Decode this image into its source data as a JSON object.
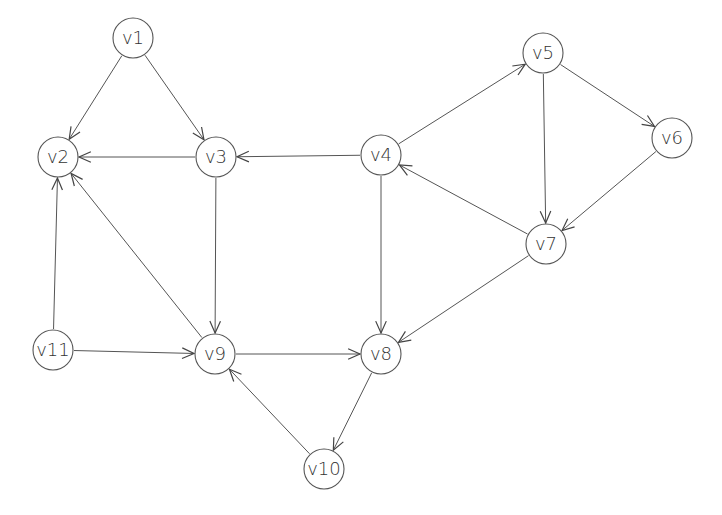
{
  "diagram": {
    "type": "directed-graph",
    "node_radius": 20,
    "colors": {
      "stroke": "#555555",
      "text": "#333333",
      "background": "#ffffff"
    },
    "nodes": [
      {
        "id": "v1",
        "label": "v1",
        "x": 133,
        "y": 38
      },
      {
        "id": "v2",
        "label": "v2",
        "x": 58,
        "y": 157
      },
      {
        "id": "v3",
        "label": "v3",
        "x": 216,
        "y": 157
      },
      {
        "id": "v4",
        "label": "v4",
        "x": 381,
        "y": 155
      },
      {
        "id": "v5",
        "label": "v5",
        "x": 543,
        "y": 53
      },
      {
        "id": "v6",
        "label": "v6",
        "x": 672,
        "y": 138
      },
      {
        "id": "v7",
        "label": "v7",
        "x": 546,
        "y": 244
      },
      {
        "id": "v8",
        "label": "v8",
        "x": 381,
        "y": 354
      },
      {
        "id": "v9",
        "label": "v9",
        "x": 215,
        "y": 354
      },
      {
        "id": "v10",
        "label": "v10",
        "x": 324,
        "y": 469
      },
      {
        "id": "v11",
        "label": "v11",
        "x": 53,
        "y": 350
      }
    ],
    "edges": [
      {
        "from": "v1",
        "to": "v2"
      },
      {
        "from": "v1",
        "to": "v3"
      },
      {
        "from": "v3",
        "to": "v2"
      },
      {
        "from": "v4",
        "to": "v3"
      },
      {
        "from": "v4",
        "to": "v5"
      },
      {
        "from": "v5",
        "to": "v6"
      },
      {
        "from": "v5",
        "to": "v7"
      },
      {
        "from": "v6",
        "to": "v7"
      },
      {
        "from": "v7",
        "to": "v4"
      },
      {
        "from": "v7",
        "to": "v8"
      },
      {
        "from": "v4",
        "to": "v8"
      },
      {
        "from": "v3",
        "to": "v9"
      },
      {
        "from": "v9",
        "to": "v2"
      },
      {
        "from": "v11",
        "to": "v2"
      },
      {
        "from": "v11",
        "to": "v9"
      },
      {
        "from": "v9",
        "to": "v8"
      },
      {
        "from": "v8",
        "to": "v10"
      },
      {
        "from": "v10",
        "to": "v9"
      }
    ]
  }
}
